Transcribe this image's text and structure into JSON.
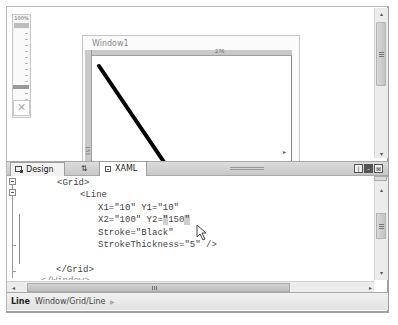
{
  "zoom": {
    "level_label": "100%",
    "fit_icon": "fit-to-window-icon"
  },
  "designer": {
    "window_title": "Window1",
    "ruler_top_value": "276",
    "ruler_left_value": "151",
    "line": {
      "x1": 10,
      "y1": 10,
      "x2": 100,
      "y2": 150,
      "stroke": "#000000",
      "stroke_thickness": 5
    }
  },
  "tabs": {
    "design_label": "Design",
    "swap_label": "⇅",
    "xaml_label": "XAML",
    "active": "XAML"
  },
  "pane_buttons": {
    "vertical_split": "vertical-split-icon",
    "horizontal_split": "horizontal-split-icon",
    "collapse": "collapse-pane-icon"
  },
  "editor": {
    "lines": [
      {
        "indent": "",
        "text": "<Grid>"
      },
      {
        "indent": "    ",
        "text": "<Line"
      },
      {
        "indent": "        ",
        "text": "X1=\"10\" Y1=\"10\""
      },
      {
        "indent": "        ",
        "text_before": "X2=\"100\" Y2=",
        "text_hl1": "\"",
        "text_mid": "150",
        "text_hl2": "\""
      },
      {
        "indent": "        ",
        "text": "Stroke=\"Black\""
      },
      {
        "indent": "        ",
        "text": "StrokeThickness=\"5\" />"
      },
      {
        "indent": "",
        "text": ""
      },
      {
        "indent": "",
        "text": "</Grid>"
      },
      {
        "indent": "",
        "text": "</Window>"
      }
    ]
  },
  "scrollbars": {
    "h_left": "◂",
    "h_right": "▸",
    "v_up": "▴",
    "v_down": "▾",
    "grip": "≡"
  },
  "status_bar": {
    "element": "Line",
    "path": "Window/Grid/Line",
    "arrow": "▶"
  }
}
